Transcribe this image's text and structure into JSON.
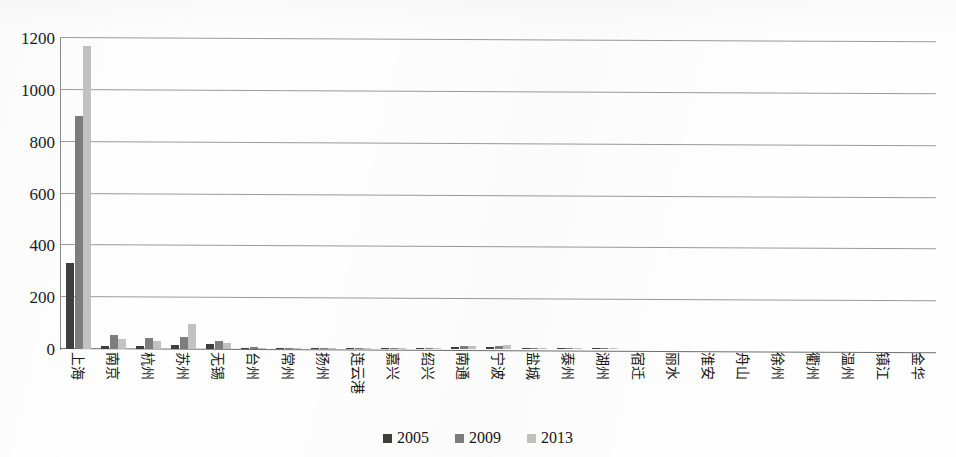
{
  "chart_data": {
    "type": "bar",
    "title": "",
    "xlabel": "",
    "ylabel": "",
    "ylim": [
      0,
      1200
    ],
    "yticks": [
      0,
      200,
      400,
      600,
      800,
      1000,
      1200
    ],
    "grid": true,
    "legend_position": "bottom-center",
    "categories": [
      "上海",
      "南京",
      "杭州",
      "苏州",
      "无锡",
      "台州",
      "常州",
      "扬州",
      "连云港",
      "嘉兴",
      "绍兴",
      "南通",
      "宁波",
      "盐城",
      "泰州",
      "湖州",
      "宿迁",
      "丽水",
      "淮安",
      "舟山",
      "徐州",
      "衢州",
      "温州",
      "镇江",
      "金华"
    ],
    "series": [
      {
        "name": "2005",
        "color": "#3e3e3e",
        "values": [
          330,
          12,
          13,
          14,
          20,
          3,
          2,
          1,
          2,
          1,
          1,
          7,
          7,
          1,
          1,
          1,
          0,
          0,
          0,
          0,
          0,
          0,
          0,
          0,
          0
        ]
      },
      {
        "name": "2009",
        "color": "#7d7d7d",
        "values": [
          900,
          55,
          42,
          48,
          32,
          6,
          3,
          2,
          5,
          2,
          2,
          13,
          12,
          2,
          1,
          1,
          0,
          0,
          0,
          0,
          0,
          0,
          0,
          0,
          0
        ]
      },
      {
        "name": "2013",
        "color": "#c2c2c2",
        "values": [
          1170,
          38,
          30,
          95,
          22,
          5,
          3,
          2,
          4,
          2,
          2,
          11,
          14,
          2,
          1,
          1,
          0,
          0,
          0,
          0,
          0,
          0,
          0,
          0,
          0
        ]
      }
    ]
  },
  "legend": {
    "items": [
      {
        "label": "2005"
      },
      {
        "label": "2009"
      },
      {
        "label": "2013"
      }
    ]
  },
  "title_sliver": ""
}
